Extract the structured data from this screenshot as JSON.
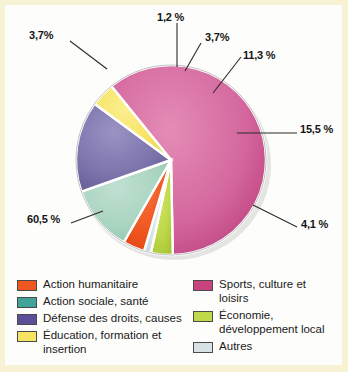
{
  "chart_data": {
    "type": "pie",
    "title": "",
    "xlabel": "",
    "ylabel": "",
    "legend_position": "bottom",
    "grid": false,
    "value_suffix": " %",
    "decimal_separator": ",",
    "categories": [
      "Sports, culture et loisirs",
      "Action sociale, santé",
      "Défense des droits, causes",
      "Éducation, formation et insertion",
      "Action humanitaire",
      "Économie, développement local",
      "Autres"
    ],
    "values": [
      60.5,
      11.3,
      15.5,
      4.1,
      3.7,
      3.7,
      1.2
    ],
    "slices": [
      {
        "key": "sports",
        "label": "Sports, culture et loisirs",
        "value": 60.5,
        "value_text": "60,5 %",
        "color": "#d4689e"
      },
      {
        "key": "economie",
        "label": "Économie, développement local",
        "value": 3.7,
        "value_text": "3,7%",
        "color": "#bfd94a"
      },
      {
        "key": "autres",
        "label": "Autres",
        "value": 1.2,
        "value_text": "1,2 %",
        "color": "#d8e2e4"
      },
      {
        "key": "humanitaire",
        "label": "Action humanitaire",
        "value": 3.7,
        "value_text": "3,7%",
        "color": "#f0561f"
      },
      {
        "key": "sociale",
        "label": "Action sociale, santé",
        "value": 11.3,
        "value_text": "11,3 %",
        "color": "#a9d4c0"
      },
      {
        "key": "droits",
        "label": "Défense des droits, causes",
        "value": 15.5,
        "value_text": "15,5 %",
        "color": "#7d74ac"
      },
      {
        "key": "education",
        "label": "Éducation, formation et insertion",
        "value": 4.1,
        "value_text": "4,1 %",
        "color": "#f7e463"
      }
    ]
  },
  "labels": {
    "green": "3,7%",
    "grey": "1,2 %",
    "orange": "3,7%",
    "teal": "11,3 %",
    "purple": "15,5 %",
    "yellow": "4,1 %",
    "pink": "60,5 %"
  },
  "legend": {
    "column_left": [
      {
        "label": "Action humanitaire",
        "color": "#f0561f"
      },
      {
        "label": "Action sociale, santé",
        "color": "#3fa39a"
      },
      {
        "label": "Défense des droits, causes",
        "color": "#5a4f98"
      },
      {
        "label": "Éducation, formation et insertion",
        "color": "#f7e463"
      }
    ],
    "column_right": [
      {
        "label": "Sports, culture et loisirs",
        "color": "#c9447e"
      },
      {
        "label": "Économie, développement local",
        "color": "#bfd94a"
      },
      {
        "label": "Autres",
        "color": "#d8e2e4"
      }
    ]
  },
  "colors": {
    "page_border": "#f7f2d4",
    "plot_background": "#fdfdfb",
    "label_text": "#151515",
    "leader_line": "#2a2a2a"
  }
}
